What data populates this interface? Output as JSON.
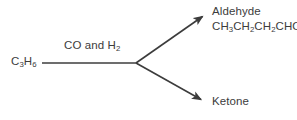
{
  "diagram": {
    "type": "reaction-scheme",
    "background_color": "#ffffff",
    "stroke_color": "#3c3c3c",
    "text_color": "#3c3c3c",
    "reactant": {
      "formula_main": "C",
      "sub_1": "3",
      "element_2": "H",
      "sub_2": "6",
      "plain": "C3H6"
    },
    "reagent": {
      "prefix": "CO and H",
      "sub": "2",
      "plain": "CO and H2"
    },
    "products": [
      {
        "name": "Aldehyde",
        "formula_parts": [
          {
            "text": "CH",
            "sub": "3"
          },
          {
            "text": "CH",
            "sub": "2"
          },
          {
            "text": "CH",
            "sub": "2"
          },
          {
            "text": "CHO",
            "sub": ""
          }
        ],
        "formula_plain": "CH3CH2CH2CHO"
      },
      {
        "name": "Ketone",
        "formula_parts": [],
        "formula_plain": ""
      }
    ],
    "arrows": {
      "stem": {
        "x1": 42,
        "y1": 63,
        "x2": 137,
        "y2": 63
      },
      "branch_upper": {
        "x1": 137,
        "y1": 63,
        "x2": 207,
        "y2": 14
      },
      "branch_lower": {
        "x1": 137,
        "y1": 63,
        "x2": 205,
        "y2": 102
      }
    }
  }
}
